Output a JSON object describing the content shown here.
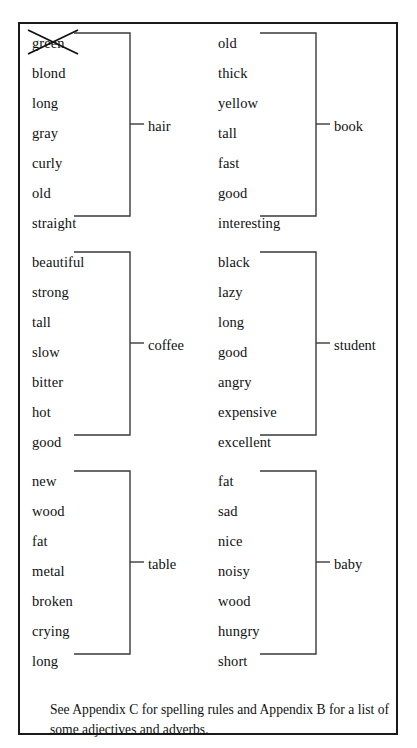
{
  "figure": {
    "groups": [
      {
        "columns": [
          {
            "words": [
              "green",
              "blond",
              "long",
              "gray",
              "curly",
              "old",
              "straight"
            ],
            "struck_index": 0,
            "label": "hair"
          },
          {
            "words": [
              "old",
              "thick",
              "yellow",
              "tall",
              "fast",
              "good",
              "interesting"
            ],
            "struck_index": -1,
            "label": "book"
          }
        ]
      },
      {
        "columns": [
          {
            "words": [
              "beautiful",
              "strong",
              "tall",
              "slow",
              "bitter",
              "hot",
              "good"
            ],
            "struck_index": -1,
            "label": "coffee"
          },
          {
            "words": [
              "black",
              "lazy",
              "long",
              "good",
              "angry",
              "expensive",
              "excellent"
            ],
            "struck_index": -1,
            "label": "student"
          }
        ]
      },
      {
        "columns": [
          {
            "words": [
              "new",
              "wood",
              "fat",
              "metal",
              "broken",
              "crying",
              "long"
            ],
            "struck_index": -1,
            "label": "table"
          },
          {
            "words": [
              "fat",
              "sad",
              "nice",
              "noisy",
              "wood",
              "hungry",
              "short"
            ],
            "struck_index": -1,
            "label": "baby"
          }
        ]
      }
    ],
    "footnote": "See Appendix C for spelling rules and Appendix B for a list of some adjectives and adverbs.",
    "colors": {
      "ink": "#111111",
      "border": "#1a1a1a",
      "rule": "#3a3a3a",
      "background": "#ffffff"
    }
  }
}
